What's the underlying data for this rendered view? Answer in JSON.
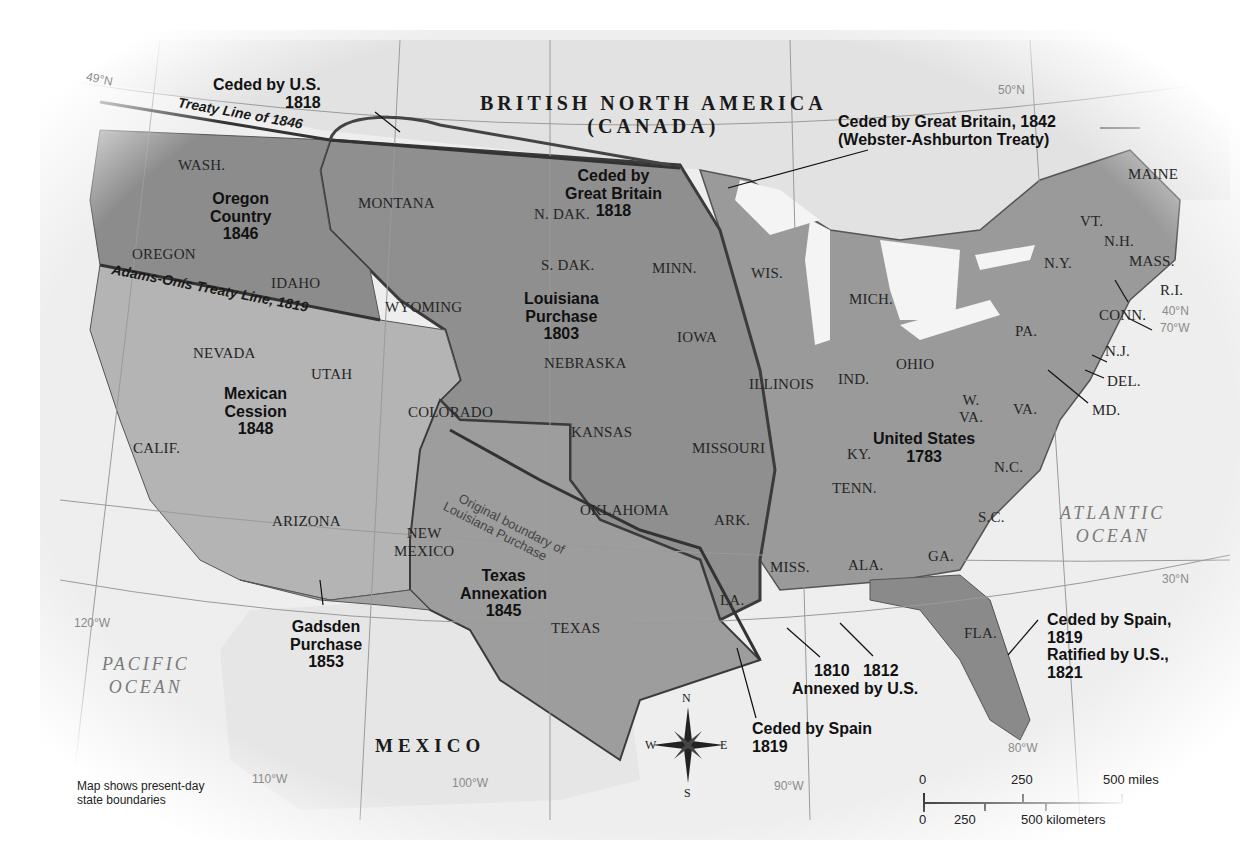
{
  "map": {
    "title_country_north": "BRITISH NORTH AMERICA",
    "title_country_north_sub": "(CANADA)",
    "country_south": "MEXICO",
    "oceans": {
      "pacific_line1": "PACIFIC",
      "pacific_line2": "OCEAN",
      "atlantic_line1": "ATLANTIC",
      "atlantic_line2": "OCEAN"
    },
    "graticule": {
      "lat_49": "49°N",
      "lat_50": "50°N",
      "lat_40": "40°N",
      "lat_30": "30°N",
      "lon_120": "120°W",
      "lon_110": "110°W",
      "lon_100": "100°W",
      "lon_90": "90°W",
      "lon_80": "80°W",
      "lon_70": "70°W"
    },
    "treaty_lines": {
      "treaty_1846": "Treaty Line of 1846",
      "adams_onis": "Adams-Onís Treaty Line, 1819",
      "original_boundary_line1": "Original boundary of",
      "original_boundary_line2": "Louisiana Purchase"
    },
    "regions": [
      {
        "id": "ceded-us-1818",
        "line1": "Ceded by U.S.",
        "line2": "1818"
      },
      {
        "id": "oregon-country",
        "line1": "Oregon",
        "line2": "Country",
        "line3": "1846"
      },
      {
        "id": "ceded-gb-1818",
        "line1": "Ceded by",
        "line2": "Great Britain",
        "line3": "1818"
      },
      {
        "id": "ceded-gb-1842",
        "line1": "Ceded by Great Britain, 1842",
        "line2": "(Webster-Ashburton Treaty)"
      },
      {
        "id": "louisiana-purchase",
        "line1": "Louisiana",
        "line2": "Purchase",
        "line3": "1803"
      },
      {
        "id": "mexican-cession",
        "line1": "Mexican",
        "line2": "Cession",
        "line3": "1848"
      },
      {
        "id": "united-states-1783",
        "line1": "United States",
        "line2": "1783"
      },
      {
        "id": "texas-annexation",
        "line1": "Texas",
        "line2": "Annexation",
        "line3": "1845"
      },
      {
        "id": "gadsden-purchase",
        "line1": "Gadsden",
        "line2": "Purchase",
        "line3": "1853"
      },
      {
        "id": "ceded-spain-1819",
        "line1": "Ceded by Spain",
        "line2": "1819"
      },
      {
        "id": "annexed-us",
        "line1a": "1810",
        "line1b": "1812",
        "line2": "Annexed by U.S."
      },
      {
        "id": "ceded-spain-florida",
        "line1": "Ceded by Spain,",
        "line2": "1819",
        "line3": "Ratified by U.S.,",
        "line4": "1821"
      }
    ],
    "states": {
      "wash": "WASH.",
      "oregon": "OREGON",
      "idaho": "IDAHO",
      "montana": "MONTANA",
      "wyoming": "WYOMING",
      "nevada": "NEVADA",
      "utah": "UTAH",
      "calif": "CALIF.",
      "arizona": "ARIZONA",
      "colorado": "COLORADO",
      "new_mexico_1": "NEW",
      "new_mexico_2": "MEXICO",
      "n_dak": "N. DAK.",
      "s_dak": "S. DAK.",
      "nebraska": "NEBRASKA",
      "kansas": "KANSAS",
      "oklahoma": "OKLAHOMA",
      "texas": "TEXAS",
      "minn": "MINN.",
      "iowa": "IOWA",
      "missouri": "MISSOURI",
      "ark": "ARK.",
      "la": "LA.",
      "wis": "WIS.",
      "illinois": "ILLINOIS",
      "mich": "MICH.",
      "ind": "IND.",
      "ohio": "OHIO",
      "ky": "KY.",
      "tenn": "TENN.",
      "miss": "MISS.",
      "ala": "ALA.",
      "ga": "GA.",
      "fla": "FLA.",
      "s_c": "S.C.",
      "n_c": "N.C.",
      "va": "VA.",
      "w_va_1": "W.",
      "w_va_2": "VA.",
      "md": "MD.",
      "del": "DEL.",
      "n_j": "N.J.",
      "pa": "PA.",
      "n_y": "N.Y.",
      "conn": "CONN.",
      "r_i": "R.I.",
      "mass": "MASS.",
      "vt": "VT.",
      "n_h": "N.H.",
      "maine": "MAINE"
    },
    "compass": {
      "n": "N",
      "s": "S",
      "e": "E",
      "w": "W"
    },
    "scale": {
      "miles_0": "0",
      "miles_250": "250",
      "miles_500": "500 miles",
      "km_0": "0",
      "km_250": "250",
      "km_500": "500 kilometers"
    },
    "note_line1": "Map shows present-day",
    "note_line2": "state boundaries",
    "colors": {
      "land_us_1783": "#9a9a9a",
      "land_louisiana": "#8f8f8f",
      "land_oregon": "#8c8c8c",
      "land_mexican_cession": "#b4b4b4",
      "land_texas": "#9d9d9d",
      "land_gadsden": "#a3a3a3",
      "land_foreign": "#e4e4e4",
      "water": "#f3f3f3",
      "boundary_dark": "#3b3b3b"
    }
  }
}
